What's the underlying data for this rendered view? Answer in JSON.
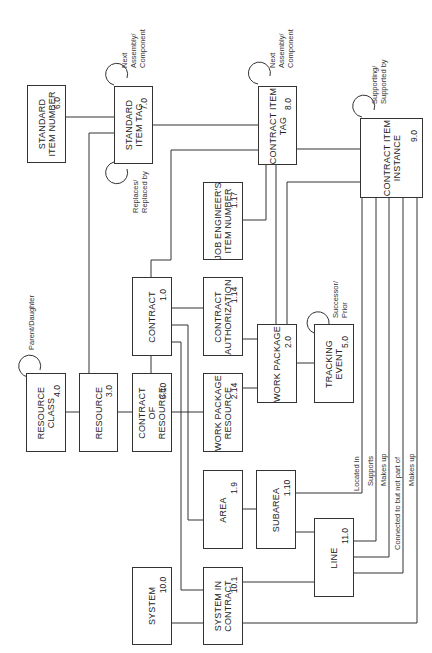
{
  "diagram": {
    "type": "entity-relationship",
    "orientation": "rotated-90-ccw",
    "entities": [
      {
        "id": "6.0",
        "name": "STANDARD ITEM NUMBER",
        "lines": [
          "STANDARD",
          "ITEM NUMBER"
        ]
      },
      {
        "id": "7.0",
        "name": "STANDARD ITEM TAG",
        "lines": [
          "STANDARD",
          "ITEM TAG"
        ]
      },
      {
        "id": "8.0",
        "name": "CONTRACT ITEM TAG",
        "lines": [
          "CONTRACT ITEM",
          "TAG"
        ]
      },
      {
        "id": "9.0",
        "name": "CONTRACT ITEM INSTANCE",
        "lines": [
          "CONTRACT ITEM",
          "INSTANCE"
        ]
      },
      {
        "id": "1.17",
        "name": "JOB ENGINEER'S ITEM NUMBER",
        "lines": [
          "JOB ENGINEER'S",
          "ITEM NUMBER"
        ]
      },
      {
        "id": "1.0",
        "name": "CONTRACT",
        "lines": [
          "CONTRACT"
        ]
      },
      {
        "id": "1.14",
        "name": "CONTRACT AUTHORIZATION",
        "lines": [
          "CONTRACT",
          "AUTHORIZATION"
        ]
      },
      {
        "id": "2.0",
        "name": "WORK PACKAGE",
        "lines": [
          "WORK PACKAGE"
        ]
      },
      {
        "id": "5.0",
        "name": "TRACKING EVENT",
        "lines": [
          "TRACKING",
          "EVENT"
        ]
      },
      {
        "id": "4.0",
        "name": "RESOURCE CLASS",
        "lines": [
          "RESOURCE",
          "CLASS"
        ]
      },
      {
        "id": "3.0",
        "name": "RESOURCE",
        "lines": [
          "RESOURCE"
        ]
      },
      {
        "id": "3.10",
        "name": "CONTRACT OF RESOURCE",
        "lines": [
          "CONTRACT",
          "OF",
          "RESOURCE"
        ]
      },
      {
        "id": "2.14",
        "name": "WORK PACKAGE RESOURCE",
        "lines": [
          "WORK PACKAGE",
          "RESOURCE"
        ]
      },
      {
        "id": "1.9",
        "name": "AREA",
        "lines": [
          "AREA"
        ]
      },
      {
        "id": "1.10",
        "name": "SUBAREA",
        "lines": [
          "SUBAREA"
        ]
      },
      {
        "id": "11.0",
        "name": "LINE",
        "lines": [
          "LINE"
        ]
      },
      {
        "id": "10.0",
        "name": "SYSTEM",
        "lines": [
          "SYSTEM"
        ]
      },
      {
        "id": "10.1",
        "name": "SYSTEM IN CONTRACT",
        "lines": [
          "SYSTEM IN",
          "CONTRACT"
        ]
      }
    ],
    "relationship_labels": {
      "std_tag_next": [
        "Next",
        "Assembly/",
        "Component"
      ],
      "std_tag_replaces": [
        "Replaces/",
        "Replaced by"
      ],
      "contract_tag_next": [
        "Next",
        "Assembly/",
        "Component"
      ],
      "instance_supporting": [
        "Supporting/",
        "Supported by"
      ],
      "resource_class_parent": "Parent/Daughter",
      "tracking_successor": [
        "Successor/",
        "Prior"
      ],
      "located_in": "Located in",
      "supports": "Supports",
      "makes_up_1": "Makes up",
      "connected_to": "Connected to but not part of",
      "makes_up_2": "Makes up"
    }
  }
}
